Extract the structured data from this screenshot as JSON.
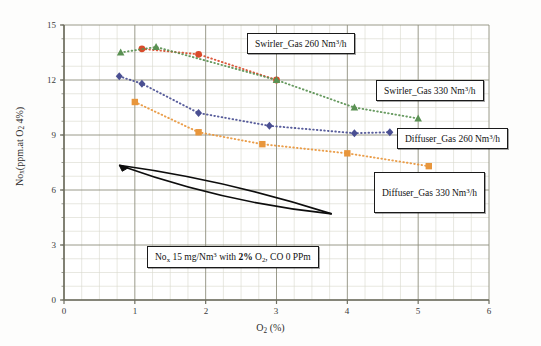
{
  "chart_data": {
    "type": "scatter",
    "title": "",
    "xlabel": "O2 (%)",
    "ylabel": "Nox(ppm.at O2 4%)",
    "xlim": [
      0,
      6
    ],
    "ylim": [
      0,
      15
    ],
    "xticks": [
      0,
      1,
      2,
      3,
      4,
      5,
      6
    ],
    "yticks": [
      0,
      3,
      6,
      9,
      12,
      15
    ],
    "grid": true,
    "minor_grid": true,
    "legend_position": "inline-callouts",
    "series": [
      {
        "name": "Swirler_Gas 260  Nm3/h",
        "color": "#d94a2b",
        "marker": "circle",
        "linestyle": "dotted",
        "x": [
          1.1,
          1.9,
          3.0
        ],
        "y": [
          13.7,
          13.4,
          12.0
        ]
      },
      {
        "name": "Swirler_Gas 330  Nm3/h",
        "color": "#5a9153",
        "marker": "triangle",
        "linestyle": "dotted",
        "x": [
          0.8,
          1.3,
          3.0,
          4.1,
          5.0
        ],
        "y": [
          13.5,
          13.8,
          12.0,
          10.5,
          9.9
        ]
      },
      {
        "name": "Diffuser_Gas 260  Nm3/h",
        "color": "#4a4f92",
        "marker": "diamond",
        "linestyle": "dotted",
        "x": [
          0.78,
          1.1,
          1.9,
          2.9,
          4.1,
          4.6
        ],
        "y": [
          12.2,
          11.8,
          10.2,
          9.5,
          9.1,
          9.15
        ]
      },
      {
        "name": "Diffuser_Gas 330  Nm3/h",
        "color": "#e8963c",
        "marker": "square",
        "linestyle": "dotted",
        "x": [
          1.0,
          1.9,
          2.8,
          4.0,
          5.15
        ],
        "y": [
          10.8,
          9.15,
          8.5,
          8.0,
          7.3
        ]
      }
    ],
    "annotations": [
      {
        "name": "trend-arrow",
        "shape": "lens-arrow",
        "from": [
          0.78,
          7.35
        ],
        "to": [
          3.78,
          4.7
        ]
      }
    ]
  },
  "axes": {
    "y_tick_labels": [
      "15",
      "12",
      "9",
      "6",
      "3",
      "0"
    ],
    "x_tick_labels": [
      "0",
      "1",
      "2",
      "3",
      "4",
      "5",
      "6"
    ],
    "y_title_parts": {
      "pre": "No",
      "sub1": "x",
      "mid": "(ppm.at O",
      "sub2": "2",
      "post": " 4%)"
    },
    "x_title_parts": {
      "pre": "O",
      "sub": "2",
      "post": " (%)"
    }
  },
  "callouts": {
    "swirler_260": {
      "pre": "Swirler_Gas 260  Nm",
      "sup": "3",
      "post": "/h"
    },
    "swirler_330": {
      "pre": "Swirler_Gas 330  Nm",
      "sup": "3",
      "post": "/h"
    },
    "diffuser_260": {
      "pre": "Diffuser_Gas 260  Nm",
      "sup": "3",
      "post": "/h"
    },
    "diffuser_330": {
      "pre": "Diffuser_Gas 330  Nm",
      "sup": "3",
      "post": "/h"
    },
    "note": {
      "p1": "No",
      "sub1": "x",
      "p2": " 15  mg/Nm",
      "sup1": "3",
      "p3": " with ",
      "p4": "2%",
      "p5": "  O",
      "sub2": "2",
      "p6": ", CO 0  PPm"
    }
  },
  "colors": {
    "swirler_260": "#d94a2b",
    "swirler_330": "#5a9153",
    "diffuser_260": "#4a4f92",
    "diffuser_330": "#e8963c",
    "major_grid": "#8f8f7e",
    "minor_grid": "#d8d8cc",
    "axis": "#6e6e60"
  }
}
